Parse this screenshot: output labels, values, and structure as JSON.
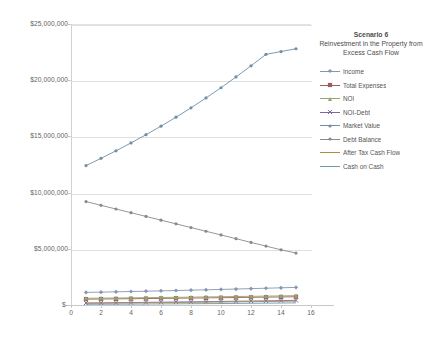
{
  "chart_data": {
    "type": "line",
    "title": "Scenario 6",
    "subtitle": "Reinvestment in the Property from Excess Cash Flow",
    "xlabel": "",
    "ylabel": "",
    "xlim": [
      0,
      16
    ],
    "ylim": [
      0,
      25000000
    ],
    "grid": true,
    "legend_position": "right",
    "x_ticks": [
      "0",
      "2",
      "4",
      "6",
      "8",
      "10",
      "12",
      "14",
      "16"
    ],
    "x_tick_values": [
      0,
      2,
      4,
      6,
      8,
      10,
      12,
      14,
      16
    ],
    "y_ticks": [
      "$-",
      "$5,000,000",
      "$10,000,000",
      "$15,000,000",
      "$20,000,000",
      "$25,000,000"
    ],
    "y_tick_values": [
      0,
      5000000,
      10000000,
      15000000,
      20000000,
      25000000
    ],
    "x": [
      1,
      2,
      3,
      4,
      5,
      6,
      7,
      8,
      9,
      10,
      11,
      12,
      13,
      14,
      15
    ],
    "series": [
      {
        "name": "Income",
        "color": "#8496b0",
        "marker": "diamond",
        "values": [
          1120000,
          1145000,
          1172000,
          1200000,
          1228000,
          1258000,
          1288000,
          1320000,
          1352000,
          1386000,
          1420000,
          1456000,
          1492000,
          1530000,
          1568000
        ]
      },
      {
        "name": "Total Expenses",
        "color": "#9e5b5b",
        "marker": "square",
        "values": [
          520000,
          533000,
          546000,
          560000,
          574000,
          588000,
          603000,
          618000,
          634000,
          650000,
          666000,
          683000,
          700000,
          717000,
          735000
        ]
      },
      {
        "name": "NOI",
        "color": "#93a86a",
        "marker": "triangle",
        "values": [
          600000,
          612000,
          626000,
          640000,
          654000,
          670000,
          685000,
          702000,
          718000,
          736000,
          754000,
          773000,
          792000,
          813000,
          833000
        ]
      },
      {
        "name": "NOI-Debt",
        "color": "#7a6aa0",
        "marker": "cross",
        "values": [
          180000,
          192000,
          206000,
          220000,
          234000,
          250000,
          265000,
          282000,
          298000,
          316000,
          334000,
          353000,
          372000,
          393000,
          413000
        ]
      },
      {
        "name": "Market Value",
        "color": "#6f8fa8",
        "marker": "dot",
        "values": [
          12400000,
          13050000,
          13720000,
          14420000,
          15150000,
          15910000,
          16710000,
          17540000,
          18420000,
          19330000,
          20290000,
          21280000,
          22300000,
          22550000,
          22800000
        ]
      },
      {
        "name": "Debt Balance",
        "color": "#8a8a8a",
        "marker": "dot",
        "values": [
          9200000,
          8870000,
          8540000,
          8210000,
          7880000,
          7550000,
          7220000,
          6890000,
          6560000,
          6230000,
          5900000,
          5570000,
          5240000,
          4910000,
          4620000
        ]
      },
      {
        "name": "After Tax Cash Flow",
        "color": "#b08a4a",
        "marker": "none",
        "values": [
          150000,
          160000,
          172000,
          184000,
          196000,
          209000,
          222000,
          236000,
          250000,
          265000,
          280000,
          296000,
          312000,
          329000,
          346000
        ]
      },
      {
        "name": "Cash on Cash",
        "color": "#6a9ab0",
        "marker": "none",
        "values": [
          60000,
          66000,
          73000,
          80000,
          88000,
          96000,
          104000,
          113000,
          122000,
          132000,
          142000,
          153000,
          164000,
          176000,
          188000
        ]
      }
    ]
  }
}
